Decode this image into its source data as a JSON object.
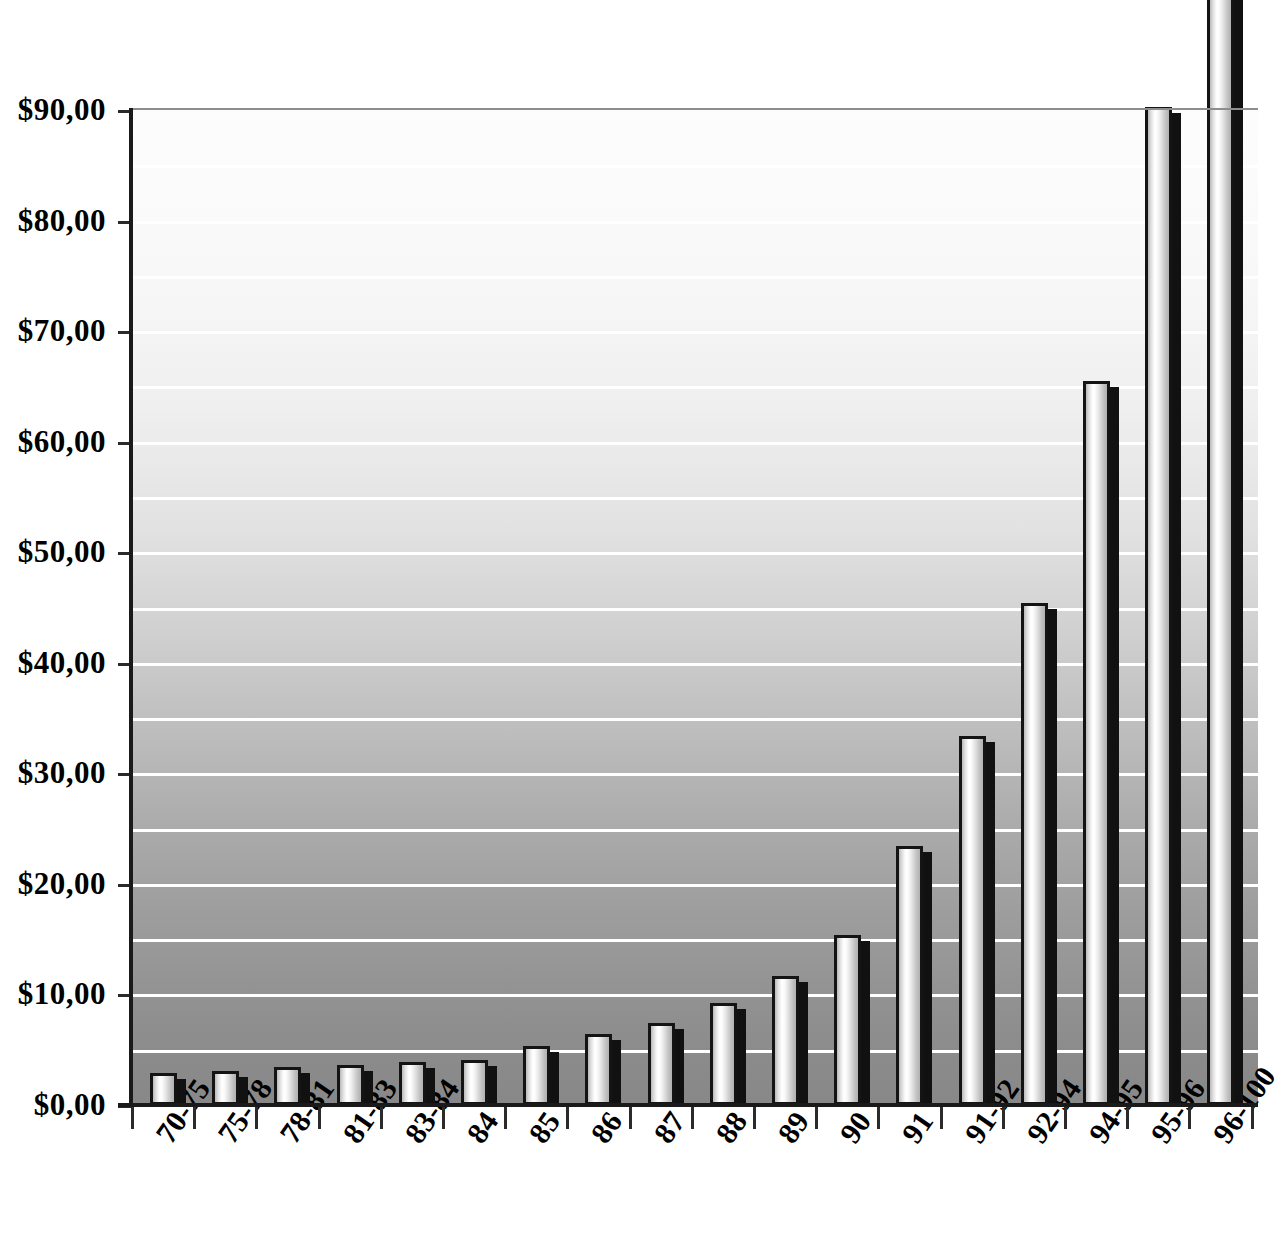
{
  "chart_data": {
    "type": "bar",
    "title": "",
    "subtitle": "",
    "xlabel": "",
    "ylabel": "",
    "categories": [
      "70-75",
      "75-78",
      "78-81",
      "81-83",
      "83-84",
      "84",
      "85",
      "86",
      "87",
      "88",
      "89",
      "90",
      "91",
      "91-92",
      "92-94",
      "94-95",
      "95-96",
      "96-100"
    ],
    "values": [
      2.9,
      3.1,
      3.4,
      3.6,
      3.9,
      4.1,
      5.3,
      6.4,
      7.4,
      9.2,
      11.7,
      15.4,
      23.4,
      33.4,
      45.4,
      65.5,
      90.3,
      101.0
    ],
    "value_prefix": "$",
    "decimal_separator": ",",
    "ylim": [
      0,
      90
    ],
    "ytick_values": [
      0,
      10,
      20,
      30,
      40,
      50,
      60,
      70,
      80,
      90
    ],
    "ytick_labels": [
      "$0,00",
      "$10,00",
      "$20,00",
      "$30,00",
      "$40,00",
      "$50,00",
      "$60,00",
      "$70,00",
      "$80,00",
      "$90,00"
    ],
    "gridline_values": [
      5,
      10,
      15,
      20,
      25,
      30,
      35,
      40,
      45,
      50,
      55,
      60,
      65,
      70,
      75,
      80,
      85,
      90
    ],
    "grid": true,
    "grid_color": "#ffffff",
    "legend": false,
    "legend_position": "none",
    "series_name": "",
    "bar_style": "cylinder-3d",
    "bar_fill_highlight": "#ffffff",
    "bar_outline_color": "#141414",
    "bar_shadow_color": "#111111",
    "plot_bg_gradient_top": "#fdfdfd",
    "plot_bg_gradient_bottom": "#888888",
    "axis_color": "#1a1a1a",
    "text_color": "#000000",
    "xtick_label_rotation": -55
  },
  "axis": {
    "y_ticks": [
      {
        "label": "$90,00",
        "value": 90
      },
      {
        "label": "$80,00",
        "value": 80
      },
      {
        "label": "$70,00",
        "value": 70
      },
      {
        "label": "$60,00",
        "value": 60
      },
      {
        "label": "$50,00",
        "value": 50
      },
      {
        "label": "$40,00",
        "value": 40
      },
      {
        "label": "$30,00",
        "value": 30
      },
      {
        "label": "$20,00",
        "value": 20
      },
      {
        "label": "$10,00",
        "value": 10
      },
      {
        "label": "$0,00",
        "value": 0
      }
    ]
  }
}
